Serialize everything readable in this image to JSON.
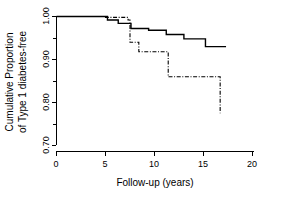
{
  "chart_data": {
    "type": "line",
    "title": "",
    "subtitle": "",
    "xlabel": "Follow-up (years)",
    "ylabel": "Cumulative Proportion of Type 1 diabetes-free",
    "ylabel_line1": "Cumulative Proportion",
    "ylabel_line2": "of Type 1 diabetes-free",
    "xlim": [
      0,
      20
    ],
    "ylim": [
      0.7,
      1.0
    ],
    "xticks": [
      0,
      5,
      10,
      15,
      20
    ],
    "xtick_labels": [
      "0",
      "5",
      "10",
      "15",
      "20"
    ],
    "yticks": [
      0.7,
      0.8,
      0.9,
      1.0
    ],
    "ytick_labels": [
      "0.70",
      "0.80",
      "0.90",
      "1.00"
    ],
    "yminor_ticks": [
      0.75,
      0.85,
      0.95
    ],
    "grid": false,
    "legend": false,
    "legend_position": "none",
    "step_type": "post",
    "series": [
      {
        "name": "solid-curve",
        "style": "solid",
        "color": "#000000",
        "x": [
          0.0,
          4.0,
          5.2,
          6.3,
          7.1,
          7.6,
          9.4,
          11.2,
          13.0,
          15.2,
          17.3
        ],
        "y": [
          1.0,
          1.0,
          0.992,
          0.984,
          0.984,
          0.972,
          0.968,
          0.958,
          0.948,
          0.93,
          0.93
        ]
      },
      {
        "name": "dash-dot-curve",
        "style": "dashdot",
        "color": "#000000",
        "x": [
          0.0,
          2.2,
          5.0,
          6.6,
          7.3,
          7.5,
          8.4,
          10.0,
          11.4,
          15.2,
          16.7
        ],
        "y": [
          1.0,
          1.0,
          0.998,
          0.998,
          0.992,
          0.94,
          0.918,
          0.918,
          0.86,
          0.86,
          0.775
        ]
      }
    ]
  }
}
